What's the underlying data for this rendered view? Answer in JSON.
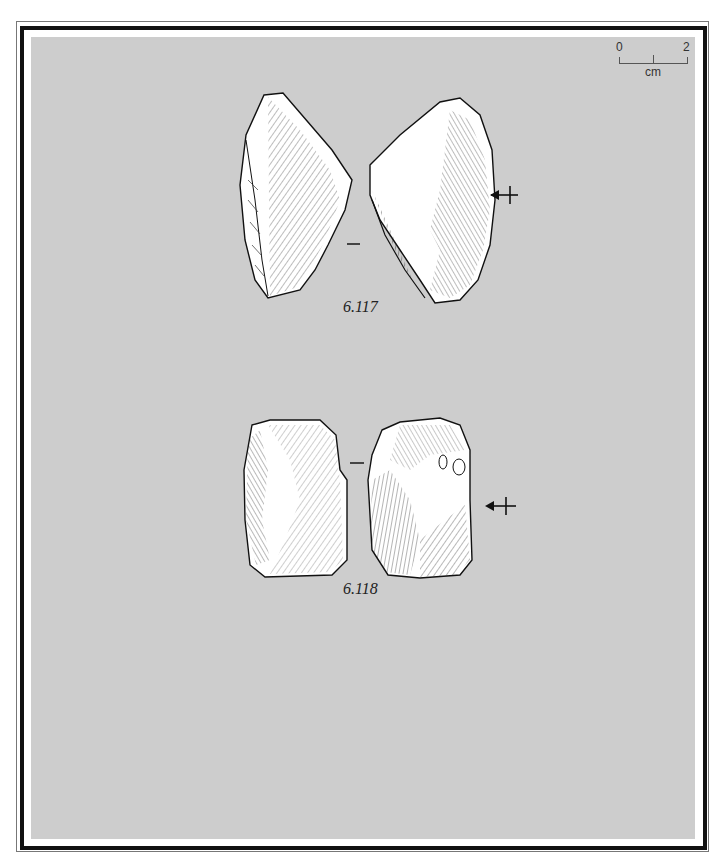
{
  "scale_bar": {
    "start": "0",
    "end": "2",
    "unit": "cm"
  },
  "figures": [
    {
      "id": "6.117",
      "label": "6.117",
      "views": [
        "ventral-view",
        "dorsal-view"
      ],
      "section_mark": "–",
      "orientation_arrow": "arrow-with-cross"
    },
    {
      "id": "6.118",
      "label": "6.118",
      "views": [
        "ventral-view",
        "dorsal-view"
      ],
      "section_mark": "–",
      "orientation_arrow": "arrow-with-cross"
    }
  ],
  "colors": {
    "panel": "#cdcdcd",
    "frame": "#111111",
    "drawing_fill": "#ffffff",
    "ink": "#1a1a1a"
  }
}
